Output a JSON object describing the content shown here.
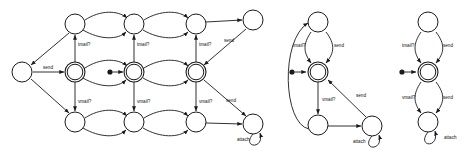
{
  "diagram": {
    "background_color": "#ffffff",
    "stroke_color": "#1a1a1a",
    "label_color": "#111111",
    "transition_labels": {
      "tmail": "tmail?",
      "vmail": "vmail?",
      "send": "send",
      "attach": "attach"
    },
    "automata": [
      {
        "id": "automaton-1",
        "name": "product-automaton",
        "accepting_state_count": 3,
        "states": [
          {
            "id": "a1-s-left",
            "cx": 22,
            "cy": 72,
            "r": 10,
            "accepting": false
          },
          {
            "id": "a1-t1",
            "cx": 75,
            "cy": 24,
            "r": 10,
            "accepting": false
          },
          {
            "id": "a1-t2",
            "cx": 134,
            "cy": 24,
            "r": 10,
            "accepting": false
          },
          {
            "id": "a1-t3",
            "cx": 196,
            "cy": 24,
            "r": 10,
            "accepting": false
          },
          {
            "id": "a1-m1",
            "cx": 75,
            "cy": 72,
            "r": 10,
            "accepting": true
          },
          {
            "id": "a1-m2",
            "cx": 134,
            "cy": 72,
            "r": 10,
            "accepting": true
          },
          {
            "id": "a1-m3",
            "cx": 196,
            "cy": 72,
            "r": 10,
            "accepting": true
          },
          {
            "id": "a1-b1",
            "cx": 75,
            "cy": 122,
            "r": 10,
            "accepting": false
          },
          {
            "id": "a1-b2",
            "cx": 134,
            "cy": 122,
            "r": 10,
            "accepting": false
          },
          {
            "id": "a1-b3",
            "cx": 196,
            "cy": 122,
            "r": 10,
            "accepting": false
          },
          {
            "id": "a1-tr",
            "cx": 253,
            "cy": 20,
            "r": 10,
            "accepting": false
          },
          {
            "id": "a1-br",
            "cx": 253,
            "cy": 124,
            "r": 10,
            "accepting": false
          }
        ],
        "start_marker": {
          "x": 110,
          "y": 72
        },
        "edge_labels": [
          {
            "text": "send",
            "x": 48,
            "y": 69
          },
          {
            "text": "tmail?",
            "x": 78,
            "y": 46
          },
          {
            "text": "tmail?",
            "x": 137,
            "y": 46
          },
          {
            "text": "tmail?",
            "x": 199,
            "y": 46
          },
          {
            "text": "vmail?",
            "x": 78,
            "y": 103
          },
          {
            "text": "vmail?",
            "x": 137,
            "y": 103
          },
          {
            "text": "vmail?",
            "x": 199,
            "y": 103
          },
          {
            "text": "send",
            "x": 224,
            "y": 42
          },
          {
            "text": "send",
            "x": 226,
            "y": 102
          },
          {
            "text": "attach",
            "x": 237,
            "y": 141
          }
        ]
      },
      {
        "id": "automaton-2",
        "name": "tmail-channel-automaton",
        "accepting_state_count": 1,
        "states": [
          {
            "id": "a2-top",
            "cx": 318,
            "cy": 22,
            "r": 10,
            "accepting": false
          },
          {
            "id": "a2-center",
            "cx": 318,
            "cy": 72,
            "r": 10,
            "accepting": true
          },
          {
            "id": "a2-bottom",
            "cx": 318,
            "cy": 125,
            "r": 10,
            "accepting": false
          },
          {
            "id": "a2-right",
            "cx": 372,
            "cy": 126,
            "r": 10,
            "accepting": false
          }
        ],
        "start_marker": {
          "x": 292,
          "y": 72
        },
        "edge_labels": [
          {
            "text": "tmail?",
            "x": 297,
            "y": 47
          },
          {
            "text": "send",
            "x": 334,
            "y": 47
          },
          {
            "text": "vmail?",
            "x": 322,
            "y": 101
          },
          {
            "text": "send",
            "x": 358,
            "y": 97
          },
          {
            "text": "attach",
            "x": 357,
            "y": 143
          }
        ]
      },
      {
        "id": "automaton-3",
        "name": "vmail-channel-automaton",
        "accepting_state_count": 1,
        "states": [
          {
            "id": "a3-top",
            "cx": 428,
            "cy": 22,
            "r": 10,
            "accepting": false
          },
          {
            "id": "a3-center",
            "cx": 428,
            "cy": 72,
            "r": 10,
            "accepting": true
          },
          {
            "id": "a3-bottom",
            "cx": 428,
            "cy": 122,
            "r": 10,
            "accepting": false
          }
        ],
        "start_marker": {
          "x": 402,
          "y": 72
        },
        "edge_labels": [
          {
            "text": "tmail?",
            "x": 405,
            "y": 47
          },
          {
            "text": "send",
            "x": 443,
            "y": 47
          },
          {
            "text": "vmail?",
            "x": 405,
            "y": 99
          },
          {
            "text": "send",
            "x": 443,
            "y": 99
          },
          {
            "text": "attach",
            "x": 446,
            "y": 139
          }
        ]
      }
    ]
  }
}
